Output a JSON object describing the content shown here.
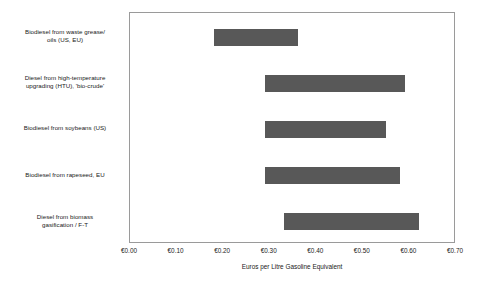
{
  "chart_data": {
    "type": "bar",
    "orientation": "horizontal",
    "subtype": "range-bar",
    "title": "",
    "xlabel": "Euros per Litre Gasoline Equivalent",
    "ylabel": "",
    "xlim": [
      0.0,
      0.7
    ],
    "xtick_labels": [
      "€0.00",
      "€0.10",
      "€0.20",
      "€0.30",
      "€0.40",
      "€0.50",
      "€0.60",
      "€0.70"
    ],
    "xtick_values": [
      0.0,
      0.1,
      0.2,
      0.3,
      0.4,
      0.5,
      0.6,
      0.7
    ],
    "grid": false,
    "legend": "none",
    "bar_color": "#585858",
    "frame_color": "#9a9a9a",
    "plot_background": "#ffffff",
    "categories": [
      "Biodiesel from waste grease/ oils (US, EU)",
      "Diesel from high-temperature upgrading (HTU), 'bio-crude'",
      "Biodiesel from soybeans (US)",
      "Biodiesel from rapeseed, EU",
      "Diesel from biomass gasification / F-T"
    ],
    "category_lines": [
      [
        "Biodiesel from waste grease/",
        "oils (US, EU)"
      ],
      [
        "Diesel from high-temperature",
        "upgrading (HTU), 'bio-crude'"
      ],
      [
        "Biodiesel from soybeans (US)"
      ],
      [
        "Biodiesel from rapeseed, EU"
      ],
      [
        "Diesel from biomass",
        "gasification / F-T"
      ]
    ],
    "bars": [
      {
        "category": "Biodiesel from waste grease/ oils (US, EU)",
        "low": 0.18,
        "high": 0.36
      },
      {
        "category": "Diesel from high-temperature upgrading (HTU), 'bio-crude'",
        "low": 0.29,
        "high": 0.59
      },
      {
        "category": "Biodiesel from soybeans (US)",
        "low": 0.29,
        "high": 0.55
      },
      {
        "category": "Biodiesel from rapeseed, EU",
        "low": 0.29,
        "high": 0.58
      },
      {
        "category": "Diesel from biomass gasification / F-T",
        "low": 0.33,
        "high": 0.62
      }
    ]
  }
}
